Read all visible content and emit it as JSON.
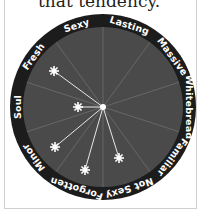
{
  "caption": "that tendency.",
  "chart_data": {
    "type": "radial-wheel",
    "title": "",
    "center": [
      103,
      107
    ],
    "categories": [
      "Sexy",
      "Lasting",
      "Massive",
      "Whitebread",
      "Familiar",
      "Not Sexy",
      "Forgotten",
      "Minor",
      "Soul",
      "Fresh"
    ],
    "markers": [
      {
        "label": "star-1",
        "x": 54,
        "y": 71
      },
      {
        "label": "star-2",
        "x": 78,
        "y": 107
      },
      {
        "label": "star-3",
        "x": 55,
        "y": 147
      },
      {
        "label": "star-4",
        "x": 85,
        "y": 170
      },
      {
        "label": "star-5",
        "x": 119,
        "y": 158
      }
    ]
  },
  "colors": {
    "rim": "#1c1c1c",
    "disk": "#4a4a4a",
    "spokes": "#6e6e6e",
    "star": "#ffffff",
    "frame": "#cfcfcf"
  }
}
